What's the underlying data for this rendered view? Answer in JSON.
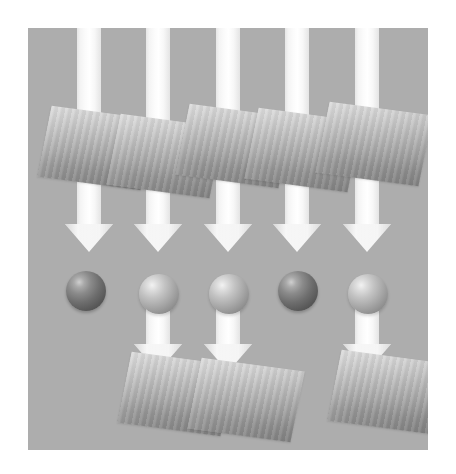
{
  "figure": {
    "title": "",
    "width": 456,
    "height": 474,
    "background_color": "#ffffff"
  },
  "stage": {
    "name": "diagram-panel",
    "background_color": "#adadad",
    "left": 28,
    "top": 28,
    "width": 400,
    "height": 422
  },
  "palette": {
    "panel_gray": "#adadad",
    "arrow_white": "#ffffff",
    "arrow_edge": "#e4e4e4",
    "slab_top": "#d9d9d9",
    "slab_bottom": "#8a8a8a",
    "sphere_light_highlight": "#f2f2f2",
    "sphere_light_shadow": "#7e7e7e",
    "sphere_dark_highlight": "#cfcfcf",
    "sphere_dark_shadow": "#4c4c4c"
  },
  "columns": [
    {
      "id": 1,
      "arrow_center_x": 89,
      "label": ""
    },
    {
      "id": 2,
      "arrow_center_x": 158,
      "label": ""
    },
    {
      "id": 3,
      "arrow_center_x": 228,
      "label": ""
    },
    {
      "id": 4,
      "arrow_center_x": 297,
      "label": ""
    },
    {
      "id": 5,
      "arrow_center_x": 367,
      "label": ""
    }
  ],
  "arrows_upper": [
    {
      "name": "arrow-down-col-1",
      "left": 65,
      "top": 28,
      "shaft_height": 196,
      "head_top": 224
    },
    {
      "name": "arrow-down-col-2",
      "left": 134,
      "top": 28,
      "shaft_height": 196,
      "head_top": 224
    },
    {
      "name": "arrow-down-col-3",
      "left": 204,
      "top": 28,
      "shaft_height": 196,
      "head_top": 224
    },
    {
      "name": "arrow-down-col-4",
      "left": 273,
      "top": 28,
      "shaft_height": 196,
      "head_top": 224
    },
    {
      "name": "arrow-down-col-5",
      "left": 343,
      "top": 28,
      "shaft_height": 196,
      "head_top": 224
    }
  ],
  "arrows_lower": [
    {
      "name": "arrow-down-lower-col-2",
      "left": 134,
      "top": 306,
      "shaft_height": 38,
      "head_top": 344
    },
    {
      "name": "arrow-down-lower-col-3",
      "left": 204,
      "top": 306,
      "shaft_height": 38,
      "head_top": 344
    },
    {
      "name": "arrow-down-lower-col-5",
      "left": 343,
      "top": 306,
      "shaft_height": 38,
      "head_top": 344
    }
  ],
  "slabs_upper": [
    {
      "name": "slab-upper-1",
      "left": 44,
      "top": 112
    },
    {
      "name": "slab-upper-2",
      "left": 113,
      "top": 120
    },
    {
      "name": "slab-upper-3",
      "left": 182,
      "top": 110
    },
    {
      "name": "slab-upper-4",
      "left": 251,
      "top": 114
    },
    {
      "name": "slab-upper-5",
      "left": 322,
      "top": 108
    }
  ],
  "slabs_lower": [
    {
      "name": "slab-lower-1",
      "left": 124,
      "top": 358
    },
    {
      "name": "slab-lower-2",
      "left": 194,
      "top": 364
    },
    {
      "name": "slab-lower-3",
      "left": 334,
      "top": 356
    }
  ],
  "spheres": [
    {
      "name": "sphere-1",
      "left": 66,
      "top": 271,
      "shade": "dark"
    },
    {
      "name": "sphere-2",
      "left": 139,
      "top": 274,
      "shade": "light"
    },
    {
      "name": "sphere-3",
      "left": 209,
      "top": 274,
      "shade": "light"
    },
    {
      "name": "sphere-4",
      "left": 278,
      "top": 271,
      "shade": "dark"
    },
    {
      "name": "sphere-5",
      "left": 348,
      "top": 274,
      "shade": "light"
    }
  ]
}
